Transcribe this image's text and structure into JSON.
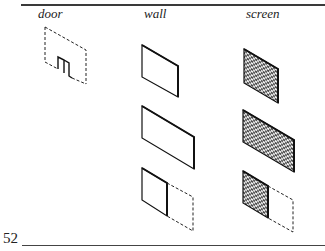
{
  "columns": [
    {
      "label": "door"
    },
    {
      "label": "wall"
    },
    {
      "label": "screen"
    }
  ],
  "page": {
    "number": "52"
  },
  "rows": [
    {
      "door": "door-panel",
      "wall": "small-wall",
      "screen": "small-screen"
    },
    {
      "wall": "wide-wall",
      "screen": "wide-screen"
    },
    {
      "wall": "half-wall",
      "screen": "half-screen"
    }
  ]
}
